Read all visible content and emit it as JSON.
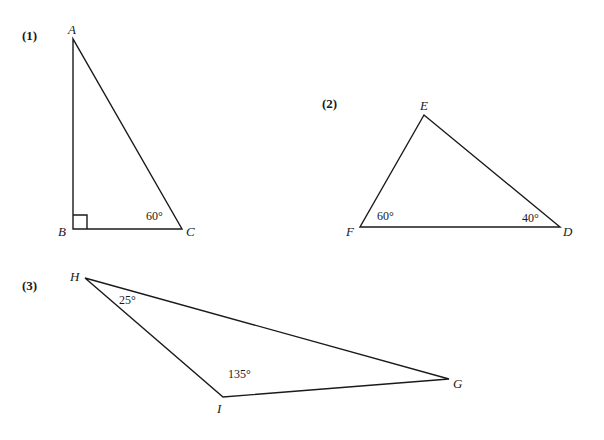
{
  "figures": [
    {
      "number": "(1)",
      "vertices": {
        "A": "A",
        "B": "B",
        "C": "C"
      },
      "angles": {
        "C": "60°",
        "B": "right-angle"
      },
      "right_angle_at": "B"
    },
    {
      "number": "(2)",
      "vertices": {
        "E": "E",
        "F": "F",
        "D": "D"
      },
      "angles": {
        "F": "60°",
        "D": "40°"
      }
    },
    {
      "number": "(3)",
      "vertices": {
        "H": "H",
        "G": "G",
        "I": "I"
      },
      "angles": {
        "H": "25°",
        "I": "135°"
      }
    }
  ],
  "colors": {
    "line": "#1a1a1a",
    "background": "#ffffff"
  }
}
